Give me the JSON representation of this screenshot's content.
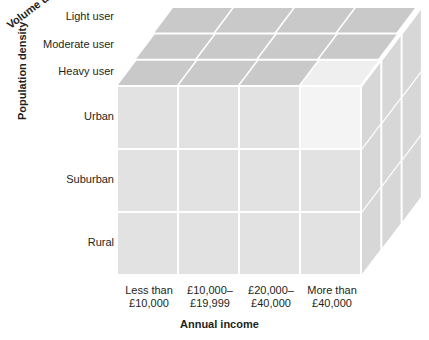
{
  "diagram": {
    "kind": "3d-segmentation-cube",
    "axes": {
      "depth": {
        "title": "Volume usage",
        "ticks": [
          "Light user",
          "Moderate user",
          "Heavy user"
        ]
      },
      "vertical": {
        "title": "Population density",
        "ticks": [
          "Urban",
          "Suburban",
          "Rural"
        ]
      },
      "horizontal": {
        "title": "Annual income",
        "ticks": [
          "Less than\n£10,000",
          "£10,000–\n£19,999",
          "£20,000–\n£40,000",
          "More than\n£40,000"
        ],
        "ticks_line1": [
          "Less than",
          "£10,000–",
          "£20,000–",
          "More than"
        ],
        "ticks_line2": [
          "£10,000",
          "£19,999",
          "£40,000",
          "£40,000"
        ]
      }
    },
    "highlighted_cell": {
      "horizontal": "More than £40,000",
      "vertical": "Urban",
      "depth": "Heavy user"
    },
    "colors": {
      "front_face": "#e2e2e2",
      "top_face": "#c9c9c9",
      "side_face": "#d7d7d7",
      "highlight_front": "#f4f4f4",
      "highlight_top": "#ededed",
      "gap": "#ffffff",
      "text": "#231f20",
      "background": "#ffffff"
    },
    "grid": {
      "columns": 4,
      "rows": 3,
      "depth_layers": 3
    }
  }
}
